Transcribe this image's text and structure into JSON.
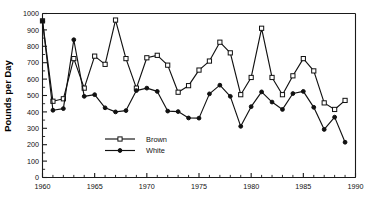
{
  "chart_data": {
    "type": "line",
    "title": "",
    "xlabel": "",
    "ylabel": "Pounds per Day",
    "xlim": [
      1960,
      1990
    ],
    "ylim": [
      0,
      1000
    ],
    "grid": false,
    "legend_position": "inside-lower-left",
    "x_ticks": [
      1960,
      1965,
      1970,
      1975,
      1980,
      1985,
      1990
    ],
    "x_tick_labels": [
      "1960",
      "1965",
      "1970",
      "1975",
      "1980",
      "1985",
      "1990"
    ],
    "x_minor_step": 1,
    "y_ticks": [
      0,
      100,
      200,
      300,
      400,
      500,
      600,
      700,
      800,
      900,
      1000
    ],
    "y_tick_labels": [
      "0",
      "100",
      "200",
      "300",
      "400",
      "500",
      "600",
      "700",
      "800",
      "900",
      "1000"
    ],
    "y_minor_step": 50,
    "x": [
      1960,
      1961,
      1962,
      1963,
      1964,
      1965,
      1966,
      1967,
      1968,
      1969,
      1970,
      1971,
      1972,
      1973,
      1974,
      1975,
      1976,
      1977,
      1978,
      1979,
      1980,
      1981,
      1982,
      1983,
      1984,
      1985,
      1986,
      1987,
      1988,
      1989
    ],
    "series": [
      {
        "name": "Brown",
        "marker": "open-square",
        "values": [
          955,
          465,
          480,
          725,
          545,
          740,
          690,
          960,
          725,
          545,
          730,
          745,
          685,
          520,
          560,
          655,
          710,
          825,
          760,
          505,
          610,
          910,
          610,
          505,
          620,
          725,
          650,
          455,
          415,
          470
        ]
      },
      {
        "name": "White",
        "marker": "filled-circle",
        "values": [
          955,
          410,
          420,
          840,
          495,
          505,
          425,
          400,
          408,
          530,
          545,
          525,
          405,
          402,
          363,
          362,
          510,
          563,
          495,
          312,
          432,
          522,
          460,
          415,
          512,
          525,
          428,
          293,
          368,
          215
        ]
      }
    ]
  },
  "legend": {
    "entries": [
      {
        "label": "Brown",
        "marker": "open-square"
      },
      {
        "label": "White",
        "marker": "filled-circle"
      }
    ]
  },
  "axis": {
    "y_title": "Pounds per Day"
  }
}
